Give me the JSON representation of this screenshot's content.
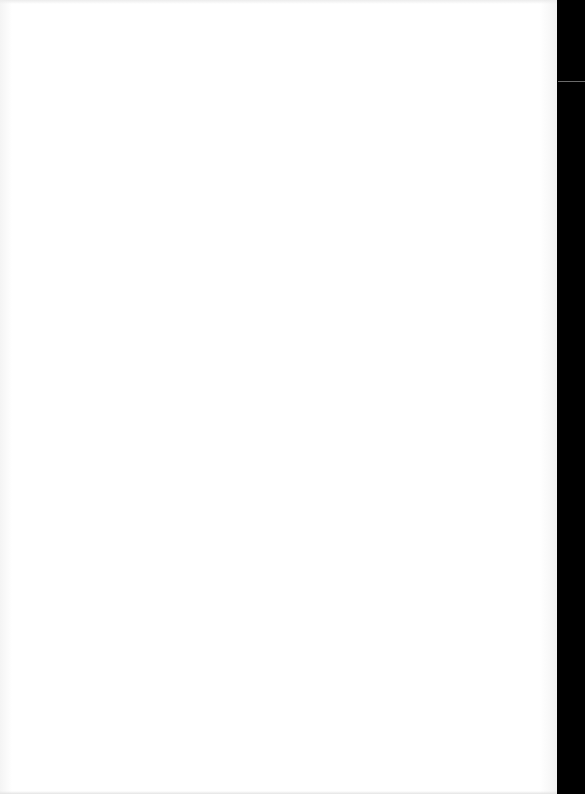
{
  "document": {
    "page_text": "",
    "background_color": "#ffffff",
    "side_strip_color": "#000000"
  }
}
